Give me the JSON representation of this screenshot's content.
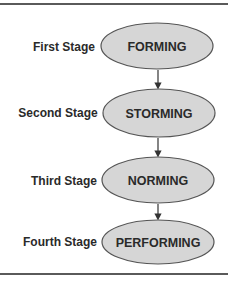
{
  "diagram": {
    "type": "flowchart",
    "colors": {
      "node_fill": "#d6d6d6",
      "node_stroke": "#555555",
      "text": "#2a2a2a",
      "rule": "#5a5a5a"
    },
    "stages": [
      {
        "label": "First Stage",
        "node": "FORMING"
      },
      {
        "label": "Second Stage",
        "node": "STORMING"
      },
      {
        "label": "Third Stage",
        "node": "NORMING"
      },
      {
        "label": "Fourth Stage",
        "node": "PERFORMING"
      }
    ],
    "edges": [
      {
        "from": "FORMING",
        "to": "STORMING"
      },
      {
        "from": "STORMING",
        "to": "NORMING"
      },
      {
        "from": "NORMING",
        "to": "PERFORMING"
      }
    ]
  }
}
